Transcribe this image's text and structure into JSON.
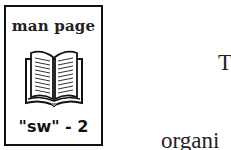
{
  "icon": {
    "title": "man page",
    "label": "\"sw\" - 2",
    "image": "open-book-icon"
  },
  "text": {
    "lines": [
      "T",
      "organi",
      "interfa",
      "Distrib"
    ]
  }
}
